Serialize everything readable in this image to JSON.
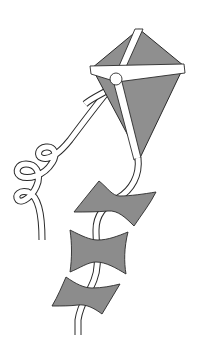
{
  "image": {
    "subject": "kite illustration",
    "width": 204,
    "height": 338
  },
  "colors": {
    "background": "#ffffff",
    "sail": "#8f8f8f",
    "bow": "#8c8c8c",
    "outline": "#2a2a2a",
    "ribbon": "#ffffff"
  },
  "elements": {
    "kite_sail": "diamond kite sail",
    "cross_spar": "horizontal spar",
    "spine": "vertical spine",
    "knot": "center knot",
    "curly_ribbon": "curly streamer ribbon",
    "tail": "kite tail",
    "bows": [
      "upper bow",
      "middle bow",
      "lower bow"
    ]
  }
}
